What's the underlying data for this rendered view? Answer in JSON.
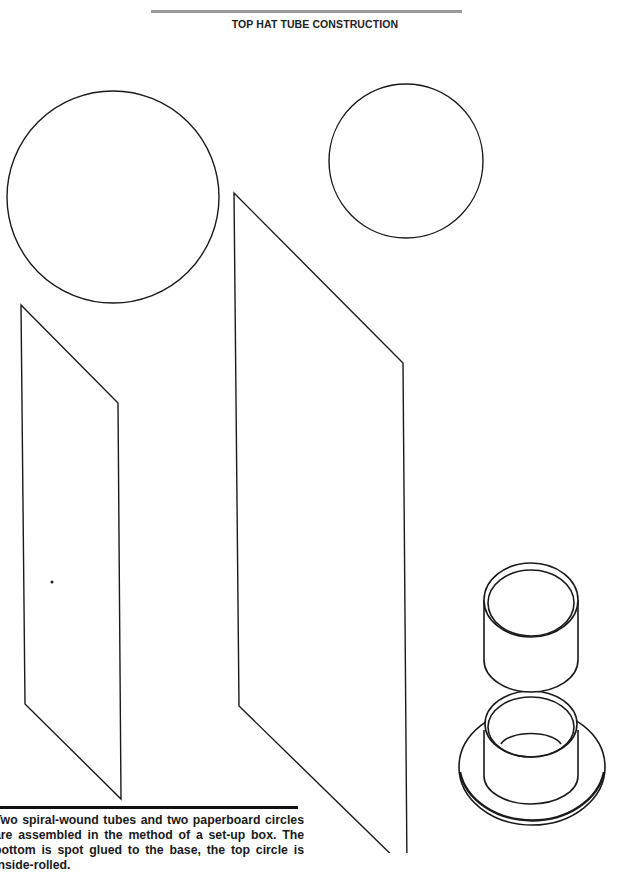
{
  "page": {
    "title": "TOP HAT TUBE CONSTRUCTION",
    "caption": "Two spiral-wound tubes and two paperboard circles are assembled in the method of a set-up box. The bottom is spot glued to the base, the top circle is inside-rolled."
  },
  "figure": {
    "components": [
      {
        "name": "large-circle",
        "shape": "circle"
      },
      {
        "name": "small-circle",
        "shape": "circle"
      },
      {
        "name": "narrow-tube-blank",
        "shape": "parallelogram"
      },
      {
        "name": "wide-tube-blank",
        "shape": "parallelogram"
      },
      {
        "name": "assembled-top-hat",
        "shape": "isometric-tubes"
      }
    ],
    "line_color": "#1a1a1a"
  }
}
